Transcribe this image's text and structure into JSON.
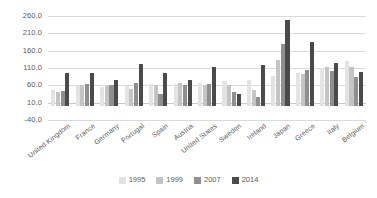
{
  "chart_data": {
    "type": "bar",
    "title": "",
    "subtitle": "",
    "xlabel": "",
    "ylabel": "",
    "ylim": [
      -40.0,
      260.0
    ],
    "ytick_labels": [
      "260.0",
      "210.0",
      "160.0",
      "110.0",
      "60.0",
      "10.0",
      "-40.0"
    ],
    "ytick_values": [
      260.0,
      210.0,
      160.0,
      110.0,
      60.0,
      10.0,
      -40.0
    ],
    "grid": true,
    "legend_position": "bottom",
    "categories": [
      "United Kingdom",
      "France",
      "Germany",
      "Portugal",
      "Spain",
      "Austria",
      "United States",
      "Sweden",
      "Ireland",
      "Japan",
      "Greece",
      "Italy",
      "Belgium"
    ],
    "series": [
      {
        "name": "1995",
        "color": "#e3e3e3",
        "values": [
          48,
          58,
          56,
          57,
          63,
          65,
          68,
          72,
          75,
          88,
          95,
          110,
          130
        ]
      },
      {
        "name": "1999",
        "color": "#c4c4c4",
        "values": [
          42,
          62,
          57,
          50,
          62,
          66,
          62,
          62,
          47,
          133,
          92,
          112,
          112
        ]
      },
      {
        "name": "2007",
        "color": "#8f8f8f",
        "values": [
          43,
          63,
          62,
          67,
          35,
          60,
          65,
          40,
          25,
          180,
          105,
          100,
          85
        ]
      },
      {
        "name": "2014",
        "color": "#4a4a4a",
        "values": [
          97,
          95,
          76,
          122,
          97,
          75,
          112,
          36,
          118,
          248,
          185,
          125,
          98
        ]
      }
    ]
  },
  "legend": {
    "items": [
      {
        "label": "1995"
      },
      {
        "label": "1999"
      },
      {
        "label": "2007"
      },
      {
        "label": "2014"
      }
    ]
  }
}
